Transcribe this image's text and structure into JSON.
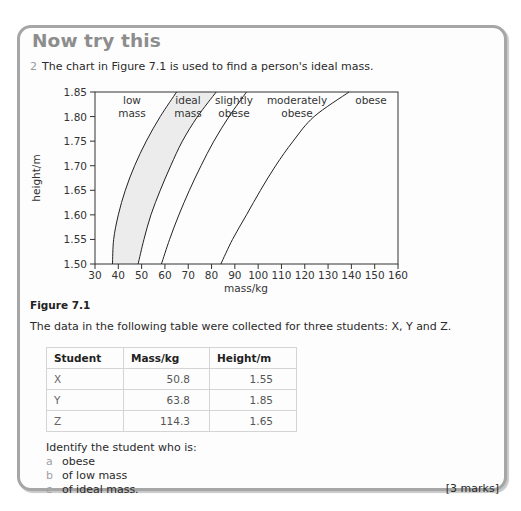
{
  "panel": {
    "title": "Now try this",
    "question_number": "2",
    "question_text": "The chart in Figure 7.1 is used to find a person's ideal mass.",
    "figure_caption": "Figure 7.1",
    "intro_text": "The data in the following table were collected for three students: X, Y and Z.",
    "table": {
      "headers": [
        "Student",
        "Mass/kg",
        "Height/m"
      ],
      "rows": [
        [
          "X",
          "50.8",
          "1.55"
        ],
        [
          "Y",
          "63.8",
          "1.85"
        ],
        [
          "Z",
          "114.3",
          "1.65"
        ]
      ]
    },
    "prompt": "Identify the student who is:",
    "parts": [
      {
        "letter": "a",
        "text": "obese"
      },
      {
        "letter": "b",
        "text": "of low mass"
      },
      {
        "letter": "c",
        "text": "of ideal mass."
      }
    ],
    "marks": "[3 marks]"
  },
  "chart_data": {
    "type": "line",
    "title": "",
    "xlabel": "mass/kg",
    "ylabel": "height/m",
    "xlim": [
      30,
      160
    ],
    "ylim": [
      1.5,
      1.85
    ],
    "x_ticks": [
      "30",
      "40",
      "50",
      "60",
      "70",
      "80",
      "90",
      "100",
      "110",
      "120",
      "130",
      "140",
      "150",
      "160"
    ],
    "y_ticks": [
      "1.50",
      "1.55",
      "1.60",
      "1.65",
      "1.70",
      "1.75",
      "1.80",
      "1.85"
    ],
    "grid": false,
    "regions": [
      {
        "label": "low mass"
      },
      {
        "label": "ideal mass",
        "shaded": true,
        "fill": "#ececec"
      },
      {
        "label": "slightly obese"
      },
      {
        "label": "moderately obese"
      },
      {
        "label": "obese"
      }
    ],
    "series": [
      {
        "name": "low/ideal boundary",
        "points": [
          [
            37.5,
            1.5
          ],
          [
            38,
            1.55
          ],
          [
            40,
            1.6
          ],
          [
            43,
            1.65
          ],
          [
            47,
            1.7
          ],
          [
            52,
            1.75
          ],
          [
            58,
            1.8
          ],
          [
            65,
            1.85
          ]
        ]
      },
      {
        "name": "ideal/slightly obese boundary",
        "points": [
          [
            48.5,
            1.5
          ],
          [
            51,
            1.55
          ],
          [
            54,
            1.6
          ],
          [
            58,
            1.65
          ],
          [
            62.5,
            1.7
          ],
          [
            67.5,
            1.75
          ],
          [
            74,
            1.8
          ],
          [
            82,
            1.85
          ]
        ]
      },
      {
        "name": "slightly/moderately obese boundary",
        "points": [
          [
            58.5,
            1.5
          ],
          [
            62,
            1.55
          ],
          [
            66,
            1.6
          ],
          [
            70.5,
            1.65
          ],
          [
            75.5,
            1.7
          ],
          [
            81,
            1.75
          ],
          [
            87.5,
            1.8
          ],
          [
            95,
            1.85
          ]
        ]
      },
      {
        "name": "moderately obese/obese boundary",
        "points": [
          [
            84,
            1.5
          ],
          [
            89,
            1.55
          ],
          [
            95,
            1.6
          ],
          [
            101,
            1.65
          ],
          [
            107.5,
            1.7
          ],
          [
            115,
            1.75
          ],
          [
            124,
            1.8
          ],
          [
            139,
            1.85
          ]
        ]
      }
    ]
  }
}
